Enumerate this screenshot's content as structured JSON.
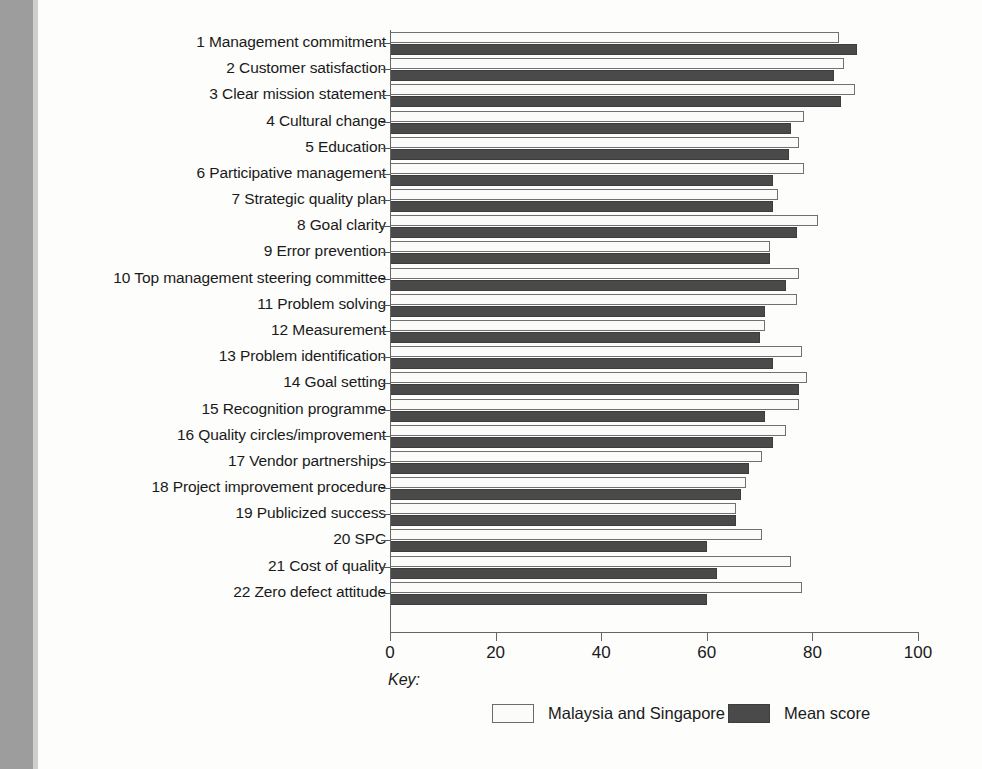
{
  "chart_data": {
    "type": "bar",
    "orientation": "horizontal",
    "title": "",
    "xlabel": "",
    "ylabel": "",
    "xlim": [
      0,
      100
    ],
    "xticks": [
      0,
      20,
      40,
      60,
      80,
      100
    ],
    "grid": false,
    "legend_position": "bottom",
    "key_label": "Key:",
    "categories": [
      "1 Management commitment",
      "2 Customer satisfaction",
      "3 Clear mission statement",
      "4 Cultural change",
      "5 Education",
      "6 Participative management",
      "7 Strategic quality plan",
      "8 Goal clarity",
      "9 Error prevention",
      "10 Top management steering committee",
      "11 Problem solving",
      "12 Measurement",
      "13 Problem identification",
      "14 Goal setting",
      "15 Recognition programme",
      "16 Quality circles/improvement",
      "17 Vendor partnerships",
      "18 Project improvement procedure",
      "19 Publicized success",
      "20 SPC",
      "21 Cost of quality",
      "22 Zero defect attitude"
    ],
    "series": [
      {
        "name": "Malaysia and Singapore",
        "color": "#fbfbfa",
        "values": [
          85,
          86,
          88,
          78.5,
          77.5,
          78.5,
          73.5,
          81,
          72,
          77.5,
          77,
          71,
          78,
          79,
          77.5,
          75,
          70.5,
          67.5,
          65.5,
          70.5,
          76,
          78
        ]
      },
      {
        "name": "Mean score",
        "color": "#4a4a4a",
        "values": [
          88.5,
          84,
          85.5,
          76,
          75.5,
          72.5,
          72.5,
          77,
          72,
          75,
          71,
          70,
          72.5,
          77.5,
          71,
          72.5,
          68,
          66.5,
          65.5,
          60,
          62,
          60
        ]
      }
    ]
  }
}
